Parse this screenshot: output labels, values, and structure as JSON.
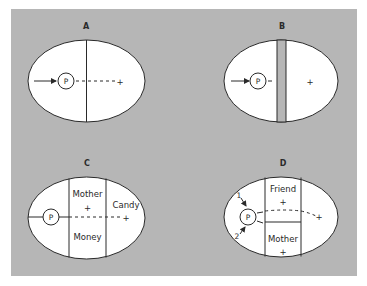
{
  "figure": {
    "background_color": "#b6b6b6",
    "ellipse_fill": "#ffffff",
    "stroke_color": "#2a2a2a",
    "panels": [
      {
        "id": "A",
        "label": "A",
        "person": "P",
        "description": "Person P moving toward a positive goal (+), separated by a single boundary line",
        "goal_sign": "+"
      },
      {
        "id": "B",
        "label": "B",
        "person": "P",
        "description": "Person P blocked from positive goal (+) by a thick barrier",
        "goal_sign": "+"
      },
      {
        "id": "C",
        "label": "C",
        "person": "P",
        "regions": [
          "Mother",
          "Money",
          "Candy"
        ],
        "region_signs": {
          "Mother": "+",
          "Candy": "+"
        },
        "description": "Path to Candy passes through Mother/Money region"
      },
      {
        "id": "D",
        "label": "D",
        "person": "P",
        "regions": [
          "Friend",
          "Mother"
        ],
        "region_signs": {
          "Friend": "+",
          "Mother": "+"
        },
        "forces": [
          "1",
          "2"
        ],
        "description": "Two forces (1, 2) act on P; path to goal passes through Friend region"
      }
    ],
    "text": {
      "a_label": "A",
      "b_label": "B",
      "c_label": "C",
      "d_label": "D",
      "p": "P",
      "plus": "+",
      "minus": "-",
      "mother": "Mother",
      "money": "Money",
      "candy": "Candy",
      "friend": "Friend",
      "force_1": "1",
      "force_2": "2"
    }
  }
}
